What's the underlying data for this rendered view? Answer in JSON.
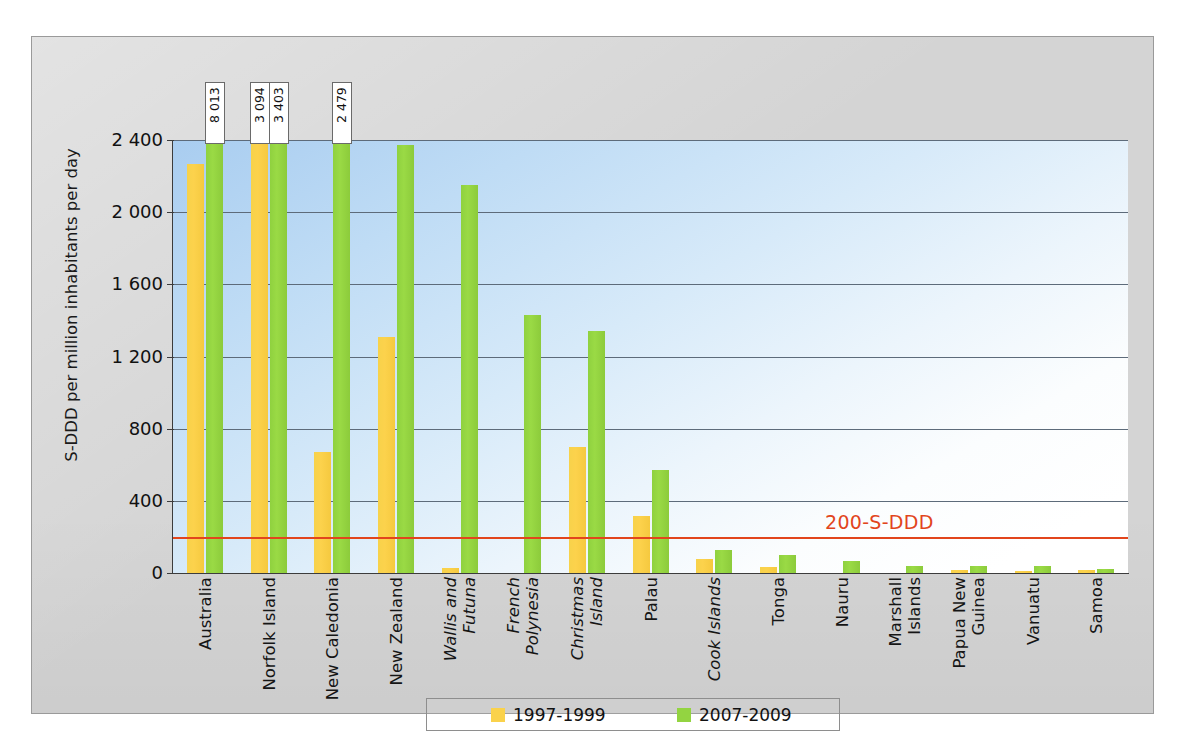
{
  "chart_data": {
    "type": "bar",
    "title": "",
    "subtitle": "",
    "xlabel": "",
    "ylabel": "S-DDD per million inhabitants per day",
    "ylim": [
      0,
      2400
    ],
    "yticks": [
      "0",
      "400",
      "800",
      "1 200",
      "1 600",
      "2 000",
      "2 400"
    ],
    "ytick_values": [
      0,
      400,
      800,
      1200,
      1600,
      2000,
      2400
    ],
    "grid": true,
    "legend_position": "bottom",
    "categories": [
      "Australia",
      "Norfolk Island",
      "New Caledonia",
      "New Zealand",
      "Wallis and Futuna",
      "French Polynesia",
      "Christmas Island",
      "Palau",
      "Cook Islands",
      "Tonga",
      "Nauru",
      "Marshall Islands",
      "Papua New Guinea",
      "Vanuatu",
      "Samoa"
    ],
    "category_style": [
      "normal",
      "normal",
      "normal",
      "normal",
      "italic",
      "italic",
      "italic",
      "normal",
      "italic",
      "normal",
      "normal",
      "normal",
      "normal",
      "normal",
      "normal"
    ],
    "series": [
      {
        "name": "1997-1999",
        "color": "#fad24b",
        "values": [
          2265,
          3094,
          670,
          1310,
          30,
          0,
          700,
          315,
          75,
          35,
          0,
          0,
          15,
          10,
          15
        ]
      },
      {
        "name": "2007-2009",
        "color": "#93d441",
        "values": [
          8013,
          3403,
          2479,
          2375,
          2150,
          1430,
          1340,
          570,
          125,
          100,
          65,
          40,
          40,
          40,
          25
        ]
      }
    ],
    "value_callouts": [
      {
        "text": "8 013",
        "category": "Australia",
        "series": "2007-2009"
      },
      {
        "text": "3 094",
        "category": "Norfolk Island",
        "series": "1997-1999"
      },
      {
        "text": "3 403",
        "category": "Norfolk Island",
        "series": "2007-2009"
      },
      {
        "text": "2 479",
        "category": "New Caledonia",
        "series": "2007-2009"
      }
    ],
    "annotations": [
      {
        "text": "200-S-DDD",
        "value": 200,
        "color": "#e2451c",
        "type": "hline-with-label"
      }
    ]
  },
  "legend": {
    "items": [
      {
        "label": "1997-1999",
        "color": "#fad24b"
      },
      {
        "label": "2007-2009",
        "color": "#93d441"
      }
    ]
  }
}
